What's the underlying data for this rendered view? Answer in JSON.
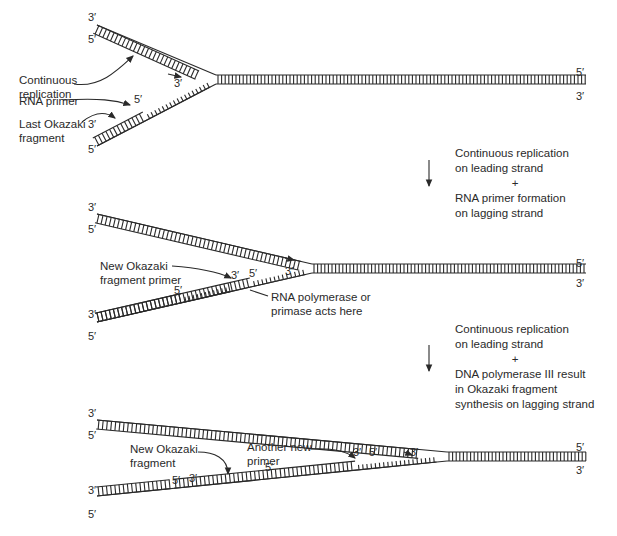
{
  "panel1": {
    "labels": {
      "continuous_replication": "Continuous\nreplication",
      "rna_primer": "RNA primer",
      "last_okazaki": "Last Okazaki\nfragment"
    },
    "ends": {
      "upper_top": "3′",
      "upper_bottom": "5′",
      "lower_top": "3′",
      "lower_bottom": "5′",
      "fork_leading": "3′",
      "primer_5": "5′",
      "right_top": "5′",
      "right_bottom": "3′"
    }
  },
  "step1": {
    "line1": "Continuous replication",
    "line2": "on leading strand",
    "plus": "+",
    "line3": "RNA primer formation",
    "line4": "on lagging strand"
  },
  "panel2": {
    "labels": {
      "new_okazaki_primer": "New Okazaki\nfragment primer",
      "rna_polymerase": "RNA polymerase or\nprimase acts here"
    },
    "ends": {
      "upper_top": "3′",
      "upper_bottom": "5′",
      "lower_top": "3′",
      "lower_bottom": "5′",
      "fragment_5": "5′",
      "primer_3": "3′",
      "primer_5": "5′",
      "fork_leading": "3′",
      "right_top": "5′",
      "right_bottom": "3′"
    }
  },
  "step2": {
    "line1": "Continuous replication",
    "line2": "on leading strand",
    "plus": "+",
    "line3": "DNA polymerase III result",
    "line4": "in Okazaki fragment",
    "line5": "synthesis on lagging strand"
  },
  "panel3": {
    "labels": {
      "new_okazaki_fragment": "New Okazaki\nfragment",
      "another_primer": "Another new\nprimer"
    },
    "ends": {
      "upper_top": "3′",
      "upper_bottom": "5′",
      "lower_top": "3′",
      "lower_bottom": "5′",
      "frag_5": "5′",
      "frag_3": "3′",
      "primer2_5_left": "5′",
      "primer2_3": "3′",
      "primer2_5": "5′",
      "fork_leading": "3′",
      "right_top": "5′",
      "right_bottom": "3′"
    }
  },
  "colors": {
    "ink": "#2a2a2a",
    "background": "#ffffff"
  }
}
